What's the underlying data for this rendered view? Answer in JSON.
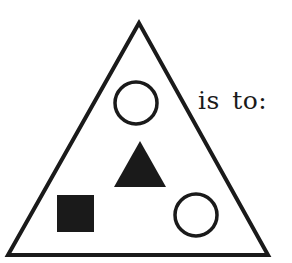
{
  "figure": {
    "caption": "is to:",
    "colors": {
      "stroke": "#1a1a1a",
      "fill": "#1a1a1a",
      "background": "#ffffff"
    },
    "outer_shape": {
      "type": "triangle",
      "style": "outline",
      "points": [
        [
          139,
          23
        ],
        [
          8,
          255
        ],
        [
          268,
          255
        ]
      ]
    },
    "inner_shapes": [
      {
        "type": "circle",
        "style": "outline",
        "position": "top",
        "cx": 136,
        "cy": 103,
        "r": 21
      },
      {
        "type": "triangle",
        "style": "filled",
        "position": "center",
        "points": [
          [
            140,
            141
          ],
          [
            114,
            187
          ],
          [
            166,
            187
          ]
        ]
      },
      {
        "type": "square",
        "style": "filled",
        "position": "bottom-left",
        "x": 57,
        "y": 195,
        "size": 37
      },
      {
        "type": "circle",
        "style": "outline",
        "position": "bottom-right",
        "cx": 196,
        "cy": 215,
        "r": 21
      }
    ]
  }
}
